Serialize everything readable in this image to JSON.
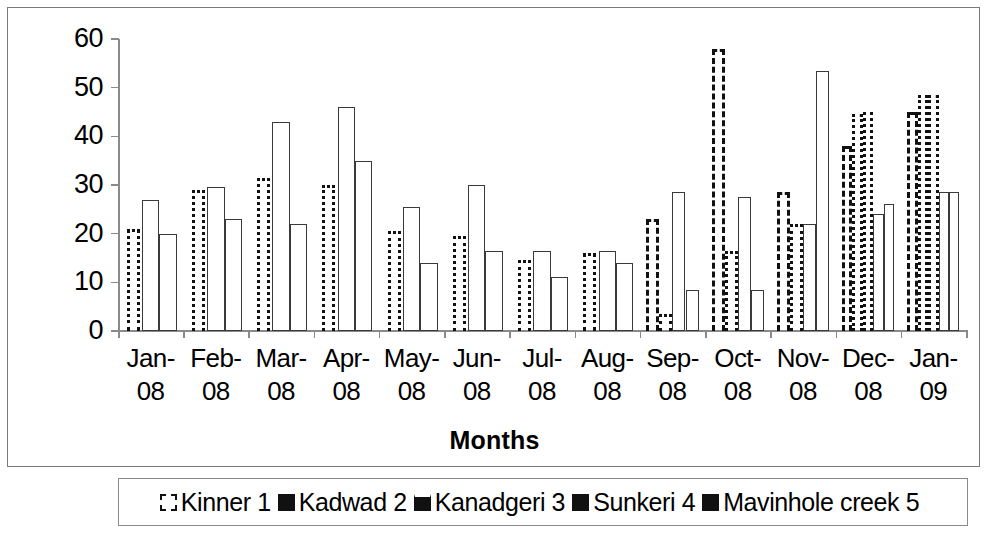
{
  "chart_data": {
    "type": "bar",
    "title": "",
    "xlabel": "Months",
    "ylabel": "",
    "ylim": [
      0,
      60
    ],
    "yticks": [
      0,
      10,
      20,
      30,
      40,
      50,
      60
    ],
    "grid": false,
    "legend_position": "bottom",
    "categories": [
      "Jan-08",
      "Feb-08",
      "Mar-08",
      "Apr-08",
      "May-08",
      "Jun-08",
      "Jul-08",
      "Aug-08",
      "Sep-08",
      "Oct-08",
      "Nov-08",
      "Dec-08",
      "Jan-09"
    ],
    "category_lines": [
      [
        "Jan-",
        "08"
      ],
      [
        "Feb-",
        "08"
      ],
      [
        "Mar-",
        "08"
      ],
      [
        "Apr-",
        "08"
      ],
      [
        "May-",
        "08"
      ],
      [
        "Jun-",
        "08"
      ],
      [
        "Jul-",
        "08"
      ],
      [
        "Aug-",
        "08"
      ],
      [
        "Sep-",
        "08"
      ],
      [
        "Oct-",
        "08"
      ],
      [
        "Nov-",
        "08"
      ],
      [
        "Dec-",
        "08"
      ],
      [
        "Jan-",
        "09"
      ]
    ],
    "series": [
      {
        "name": "Kinner 1",
        "style": "dashed",
        "values": [
          0,
          0,
          0,
          0,
          0,
          0,
          0,
          0,
          23,
          58,
          28.5,
          38,
          45
        ]
      },
      {
        "name": "Kadwad 2",
        "style": "dotted",
        "values": [
          21,
          29,
          31.5,
          30,
          20.5,
          19.5,
          14.5,
          16,
          3.5,
          16.5,
          22,
          44.5,
          48.5
        ]
      },
      {
        "name": "Kanadgeri 3",
        "style": "dotted",
        "values": [
          0,
          0,
          0,
          0,
          0,
          0,
          0,
          0,
          0,
          0,
          0,
          45,
          48.5
        ]
      },
      {
        "name": "Sunkeri 4",
        "style": "solid",
        "values": [
          27,
          29.5,
          43,
          46,
          25.5,
          30,
          16.5,
          16.5,
          28.5,
          27.5,
          22,
          24,
          28.5
        ]
      },
      {
        "name": "Mavinhole creek 5",
        "style": "solid",
        "values": [
          20,
          23,
          22,
          35,
          14,
          16.5,
          11,
          14,
          8.5,
          8.5,
          53.5,
          26,
          28.5
        ]
      }
    ]
  },
  "legend": {
    "items": [
      {
        "label": "Kinner 1",
        "swatch": "open-dashed-swatch-icon"
      },
      {
        "label": "Kadwad 2",
        "swatch": "filled-swatch-icon"
      },
      {
        "label": "Kanadgeri 3",
        "swatch": "filled-swatch-icon"
      },
      {
        "label": "Sunkeri 4",
        "swatch": "filled-swatch-icon"
      },
      {
        "label": "Mavinhole creek 5",
        "swatch": "filled-swatch-icon"
      }
    ]
  },
  "axis": {
    "x_title": "Months",
    "y_ticks": [
      "60",
      "50",
      "40",
      "30",
      "20",
      "10",
      "0"
    ]
  }
}
